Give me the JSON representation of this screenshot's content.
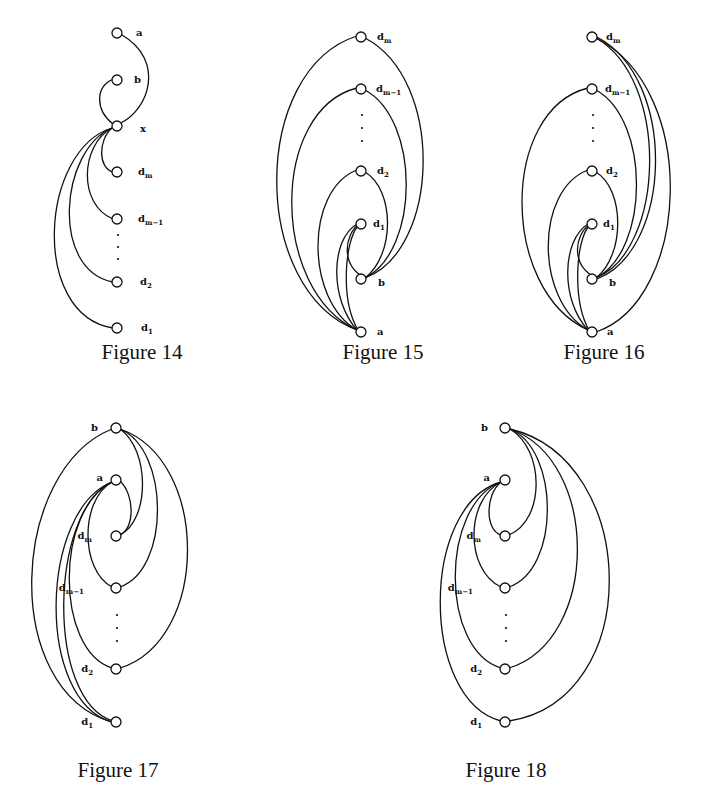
{
  "figures": [
    {
      "id": "figure-14",
      "caption": "Figure 14",
      "caption_pos": [
        142,
        340
      ],
      "nodes": [
        {
          "id": "a",
          "label": "a",
          "sub": "",
          "x": 117,
          "y": 33,
          "lx": 136,
          "ly": 36
        },
        {
          "id": "b",
          "label": "b",
          "sub": "",
          "x": 117,
          "y": 80,
          "lx": 134,
          "ly": 83
        },
        {
          "id": "x",
          "label": "x",
          "sub": "",
          "x": 117,
          "y": 126,
          "lx": 140,
          "ly": 132
        },
        {
          "id": "dm",
          "label": "d",
          "sub": "m",
          "x": 117,
          "y": 172,
          "lx": 138,
          "ly": 175
        },
        {
          "id": "dm1",
          "label": "d",
          "sub": "m−1",
          "x": 117,
          "y": 219,
          "lx": 138,
          "ly": 222
        },
        {
          "id": "d2",
          "label": "d",
          "sub": "2",
          "x": 117,
          "y": 282,
          "lx": 140,
          "ly": 285
        },
        {
          "id": "d1",
          "label": "d",
          "sub": "1",
          "x": 117,
          "y": 328,
          "lx": 141,
          "ly": 331
        }
      ],
      "dots": [
        [
          118,
          235
        ],
        [
          118,
          247
        ],
        [
          118,
          259
        ]
      ],
      "edges": [
        {
          "from": "x",
          "to": "a",
          "path": "M119,124 C150,110 165,60 122,35"
        },
        {
          "from": "x",
          "to": "b",
          "path": "M113,124 C95,110 95,85 114,79"
        },
        {
          "from": "x",
          "to": "dm",
          "path": "M112,128 C98,140 98,168 113,172"
        },
        {
          "from": "x",
          "to": "dm1",
          "path": "M112,128 C80,145 78,205 113,219"
        },
        {
          "from": "x",
          "to": "d2",
          "path": "M112,128 C60,150 50,270 113,282"
        },
        {
          "from": "x",
          "to": "d1",
          "path": "M112,128 C40,150 30,315 113,328"
        }
      ]
    },
    {
      "id": "figure-15",
      "caption": "Figure 15",
      "caption_pos": [
        383,
        340
      ],
      "nodes": [
        {
          "id": "dm",
          "label": "d",
          "sub": "m",
          "x": 361,
          "y": 37,
          "lx": 377,
          "ly": 40
        },
        {
          "id": "dm1",
          "label": "d",
          "sub": "m−1",
          "x": 361,
          "y": 89,
          "lx": 376,
          "ly": 92
        },
        {
          "id": "d2",
          "label": "d",
          "sub": "2",
          "x": 361,
          "y": 171,
          "lx": 377,
          "ly": 174
        },
        {
          "id": "d1",
          "label": "d",
          "sub": "1",
          "x": 361,
          "y": 224,
          "lx": 373,
          "ly": 227
        },
        {
          "id": "b",
          "label": "b",
          "sub": "",
          "x": 361,
          "y": 279,
          "lx": 378,
          "ly": 286
        },
        {
          "id": "a",
          "label": "a",
          "sub": "",
          "x": 361,
          "y": 332,
          "lx": 377,
          "ly": 335
        }
      ],
      "dots": [
        [
          362,
          115
        ],
        [
          362,
          128
        ],
        [
          362,
          141
        ]
      ],
      "edges": [
        {
          "from": "a",
          "to": "dm",
          "path": "M357,330 C250,290 250,70 357,36"
        },
        {
          "from": "a",
          "to": "dm1",
          "path": "M357,330 C270,290 270,110 357,88"
        },
        {
          "from": "a",
          "to": "d2",
          "path": "M357,330 C305,300 305,190 357,170"
        },
        {
          "from": "a",
          "to": "d1",
          "path": "M357,330 C330,300 330,240 357,224"
        },
        {
          "from": "a",
          "to": "d1",
          "path": "M358,330 C340,300 345,240 358,226"
        },
        {
          "from": "b",
          "to": "d1",
          "path": "M365,278 C340,265 345,235 358,225"
        },
        {
          "from": "b",
          "to": "d2",
          "path": "M365,278 C395,255 395,190 365,172"
        },
        {
          "from": "b",
          "to": "dm1",
          "path": "M365,278 C420,250 420,120 365,90"
        },
        {
          "from": "b",
          "to": "dm",
          "path": "M365,278 C440,250 445,80 365,38"
        }
      ]
    },
    {
      "id": "figure-16",
      "caption": "Figure 16",
      "caption_pos": [
        604,
        340
      ],
      "nodes": [
        {
          "id": "dm",
          "label": "d",
          "sub": "m",
          "x": 592,
          "y": 37,
          "lx": 606,
          "ly": 40
        },
        {
          "id": "dm1",
          "label": "d",
          "sub": "m−1",
          "x": 592,
          "y": 89,
          "lx": 605,
          "ly": 92
        },
        {
          "id": "d2",
          "label": "d",
          "sub": "2",
          "x": 592,
          "y": 171,
          "lx": 606,
          "ly": 174
        },
        {
          "id": "d1",
          "label": "d",
          "sub": "1",
          "x": 592,
          "y": 224,
          "lx": 603,
          "ly": 227
        },
        {
          "id": "b",
          "label": "b",
          "sub": "",
          "x": 592,
          "y": 279,
          "lx": 609,
          "ly": 286
        },
        {
          "id": "a",
          "label": "a",
          "sub": "",
          "x": 592,
          "y": 332,
          "lx": 607,
          "ly": 335
        }
      ],
      "dots": [
        [
          593,
          115
        ],
        [
          593,
          128
        ],
        [
          593,
          141
        ]
      ],
      "edges": [
        {
          "from": "a",
          "to": "dm1",
          "path": "M588,330 C500,290 500,110 588,88"
        },
        {
          "from": "a",
          "to": "d2",
          "path": "M588,330 C535,300 535,190 588,170"
        },
        {
          "from": "a",
          "to": "d1",
          "path": "M588,330 C560,300 562,240 588,224"
        },
        {
          "from": "a",
          "to": "d1",
          "path": "M589,330 C572,300 576,240 589,226"
        },
        {
          "from": "a",
          "to": "dm",
          "path": "M596,332 C690,300 700,90 596,38"
        },
        {
          "from": "b",
          "to": "d1",
          "path": "M596,278 C570,265 575,235 589,225"
        },
        {
          "from": "b",
          "to": "d2",
          "path": "M596,278 C625,255 625,190 596,172"
        },
        {
          "from": "b",
          "to": "dm1",
          "path": "M596,278 C650,250 650,120 596,90"
        },
        {
          "from": "b",
          "to": "dm",
          "path": "M596,278 C665,250 670,80 596,38"
        },
        {
          "from": "b",
          "to": "dm",
          "path": "M597,279 C672,250 678,80 597,37"
        }
      ]
    },
    {
      "id": "figure-17",
      "caption": "Figure 17",
      "caption_pos": [
        118,
        758
      ],
      "nodes": [
        {
          "id": "b",
          "label": "b",
          "sub": "",
          "x": 116,
          "y": 428,
          "lx": 98,
          "ly": 431,
          "anchor": "end"
        },
        {
          "id": "a",
          "label": "a",
          "sub": "",
          "x": 116,
          "y": 480,
          "lx": 103,
          "ly": 481,
          "anchor": "end"
        },
        {
          "id": "dm",
          "label": "d",
          "sub": "m",
          "x": 116,
          "y": 536,
          "lx": 92,
          "ly": 539,
          "anchor": "end"
        },
        {
          "id": "dm1",
          "label": "d",
          "sub": "m−1",
          "x": 116,
          "y": 588,
          "lx": 84,
          "ly": 591,
          "anchor": "end"
        },
        {
          "id": "d2",
          "label": "d",
          "sub": "2",
          "x": 116,
          "y": 669,
          "lx": 93,
          "ly": 672,
          "anchor": "end"
        },
        {
          "id": "d1",
          "label": "d",
          "sub": "1",
          "x": 116,
          "y": 722,
          "lx": 93,
          "ly": 725,
          "anchor": "end"
        }
      ],
      "dots": [
        [
          117,
          615
        ],
        [
          117,
          628
        ],
        [
          117,
          641
        ]
      ],
      "edges": [
        {
          "from": "b",
          "to": "d1",
          "path": "M112,429 C10,470 0,690 112,722"
        },
        {
          "from": "b",
          "to": "dm",
          "path": "M120,429 C150,450 150,520 120,535"
        },
        {
          "from": "b",
          "to": "dm1",
          "path": "M120,429 C170,450 170,570 120,587"
        },
        {
          "from": "b",
          "to": "d2",
          "path": "M120,429 C210,460 210,640 120,668"
        },
        {
          "from": "a",
          "to": "dm",
          "path": "M120,481 C135,495 135,530 119,535"
        },
        {
          "from": "a",
          "to": "dm1",
          "path": "M112,482 C80,500 80,570 112,587"
        },
        {
          "from": "a",
          "to": "d2",
          "path": "M112,482 C55,510 55,650 112,668"
        },
        {
          "from": "a",
          "to": "d1",
          "path": "M112,482 C40,510 35,700 112,722"
        },
        {
          "from": "a",
          "to": "d1",
          "path": "M112,482 C50,510 45,700 113,721"
        }
      ]
    },
    {
      "id": "figure-18",
      "caption": "Figure 18",
      "caption_pos": [
        506,
        758
      ],
      "nodes": [
        {
          "id": "b",
          "label": "b",
          "sub": "",
          "x": 505,
          "y": 428,
          "lx": 488,
          "ly": 431,
          "anchor": "end"
        },
        {
          "id": "a",
          "label": "a",
          "sub": "",
          "x": 505,
          "y": 480,
          "lx": 490,
          "ly": 481,
          "anchor": "end"
        },
        {
          "id": "dm",
          "label": "d",
          "sub": "m",
          "x": 505,
          "y": 536,
          "lx": 481,
          "ly": 539,
          "anchor": "end"
        },
        {
          "id": "dm1",
          "label": "d",
          "sub": "m−1",
          "x": 505,
          "y": 588,
          "lx": 473,
          "ly": 591,
          "anchor": "end"
        },
        {
          "id": "d2",
          "label": "d",
          "sub": "2",
          "x": 505,
          "y": 669,
          "lx": 482,
          "ly": 672,
          "anchor": "end"
        },
        {
          "id": "d1",
          "label": "d",
          "sub": "1",
          "x": 505,
          "y": 722,
          "lx": 482,
          "ly": 725,
          "anchor": "end"
        }
      ],
      "dots": [
        [
          506,
          615
        ],
        [
          506,
          628
        ],
        [
          506,
          641
        ]
      ],
      "edges": [
        {
          "from": "b",
          "to": "dm",
          "path": "M510,429 C545,450 545,520 509,535"
        },
        {
          "from": "b",
          "to": "dm1",
          "path": "M510,429 C560,450 560,570 509,587"
        },
        {
          "from": "b",
          "to": "d2",
          "path": "M510,429 C600,460 600,640 509,668"
        },
        {
          "from": "b",
          "to": "d1",
          "path": "M510,429 C640,460 645,700 509,721"
        },
        {
          "from": "a",
          "to": "dm",
          "path": "M501,482 C485,495 485,530 501,535"
        },
        {
          "from": "a",
          "to": "dm1",
          "path": "M501,482 C465,500 465,570 501,587"
        },
        {
          "from": "a",
          "to": "d2",
          "path": "M501,482 C440,505 440,650 501,668"
        },
        {
          "from": "a",
          "to": "d1",
          "path": "M501,482 C420,505 420,700 501,721"
        }
      ]
    }
  ]
}
